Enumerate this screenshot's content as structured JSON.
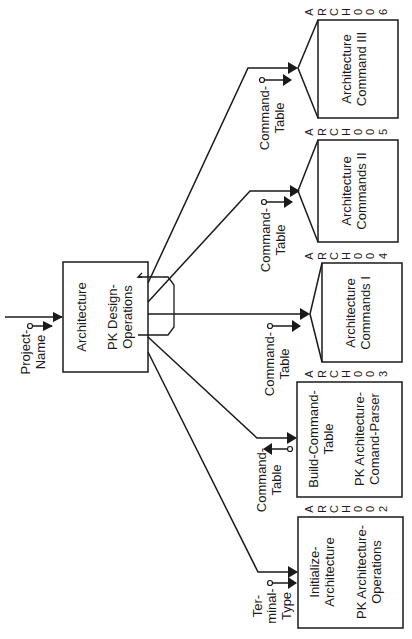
{
  "main_module": {
    "line1": "Architecture",
    "line2": "PK Design-",
    "line3": "Operations",
    "input": {
      "line1": "Project-",
      "line2": "Name"
    }
  },
  "modules": [
    {
      "id": "arch006",
      "line1": "Architecture",
      "line2": "Command III",
      "code": [
        "A",
        "R",
        "C",
        "H",
        "0",
        "0",
        "6"
      ],
      "param": {
        "line1": "Command-",
        "line2": "Table"
      }
    },
    {
      "id": "arch005",
      "line1": "Architecture",
      "line2": "Commands II",
      "code": [
        "A",
        "R",
        "C",
        "H",
        "0",
        "0",
        "5"
      ],
      "param": {
        "line1": "Command-",
        "line2": "Table"
      }
    },
    {
      "id": "arch004",
      "line1": "Architecture",
      "line2": "Commands I",
      "code": [
        "A",
        "R",
        "C",
        "H",
        "0",
        "0",
        "4"
      ],
      "param": {
        "line1": "Command-",
        "line2": "Table"
      }
    },
    {
      "id": "arch003",
      "line1": "Build-Command-",
      "line2": "Table",
      "line3": "PK Architecture-",
      "line4": "Comand-Parser",
      "code": [
        "A",
        "R",
        "C",
        "H",
        "0",
        "0",
        "3"
      ],
      "param": {
        "line1": "Command-",
        "line2": "Table"
      }
    },
    {
      "id": "arch002",
      "line1": "Initialize-",
      "line2": "Architecture",
      "line3": "PK Architecture-",
      "line4": "Operations",
      "code": [
        "A",
        "R",
        "C",
        "H",
        "0",
        "0",
        "2"
      ],
      "param": {
        "line1": "Ter-",
        "line2": "minal-",
        "line3": "Type"
      }
    }
  ]
}
